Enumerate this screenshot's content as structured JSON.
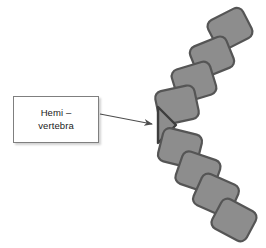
{
  "figure": {
    "background_color": "#ffffff"
  },
  "callout": {
    "line1": "Hemi –",
    "line2": "vertebra",
    "border_color": "#7f7f7f",
    "fill_color": "#ffffff",
    "text_color": "#1a1a1a",
    "x": 13,
    "y": 96,
    "width": 86,
    "height": 47
  },
  "arrow": {
    "name": "callout-arrow",
    "color": "#4d4d4d",
    "start_x": 100,
    "start_y": 114,
    "end_x": 152,
    "end_y": 124
  },
  "spine": {
    "vertebra_fill": "#8d8d8d",
    "vertebra_stroke": "#555555",
    "hemivertebra_fill": "#8d8d8d",
    "hemivertebra_stroke": "#3d3d3d",
    "upper_segment_count": 4,
    "lower_segment_count": 4,
    "hemivertebra_count": 1,
    "upper_vertebrae": [
      {
        "label": "upper-vertebra-1",
        "cx": 230,
        "cy": 29,
        "w": 39,
        "h": 33,
        "rotation": -27
      },
      {
        "label": "upper-vertebra-2",
        "cx": 212,
        "cy": 57,
        "w": 39,
        "h": 33,
        "rotation": -22
      },
      {
        "label": "upper-vertebra-3",
        "cx": 194,
        "cy": 82,
        "w": 40,
        "h": 34,
        "rotation": -17
      },
      {
        "label": "upper-vertebra-4",
        "cx": 177,
        "cy": 105,
        "w": 40,
        "h": 34,
        "rotation": -12
      }
    ],
    "hemivertebra": {
      "label": "hemivertebra-wedge",
      "apex_x": 176,
      "apex_y": 125,
      "top_x": 158,
      "top_y": 107,
      "bottom_x": 158,
      "bottom_y": 143
    },
    "lower_vertebrae": [
      {
        "label": "lower-vertebra-1",
        "cx": 180,
        "cy": 148,
        "w": 40,
        "h": 34,
        "rotation": 14
      },
      {
        "label": "lower-vertebra-2",
        "cx": 198,
        "cy": 172,
        "w": 40,
        "h": 34,
        "rotation": 19
      },
      {
        "label": "lower-vertebra-3",
        "cx": 216,
        "cy": 195,
        "w": 40,
        "h": 34,
        "rotation": 24
      },
      {
        "label": "lower-vertebra-4",
        "cx": 234,
        "cy": 220,
        "w": 39,
        "h": 33,
        "rotation": 28
      }
    ]
  }
}
